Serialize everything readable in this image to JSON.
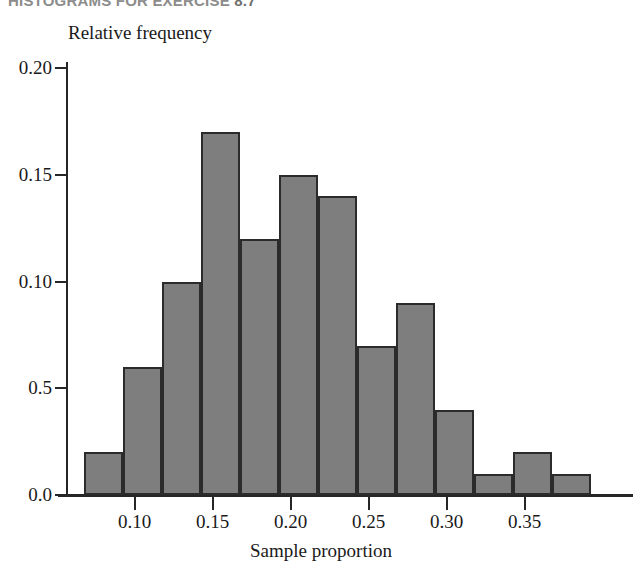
{
  "header": {
    "text": "HISTOGRAMS FOR EXERCISE ",
    "number": "8.7"
  },
  "figure": {
    "y_axis_title": "Relative frequency",
    "x_axis_title": "Sample proportion"
  },
  "chart_data": {
    "type": "bar",
    "title": "",
    "subtitle": "",
    "xlabel": "Sample proportion",
    "ylabel": "Relative frequency",
    "grid": false,
    "legend": "none",
    "bar_color": "#7e7e7e",
    "bar_edge_color": "#2b2b2b",
    "xlim": [
      0.0575,
      0.3925
    ],
    "ylim": [
      0.0,
      0.215
    ],
    "bin_width": 0.025,
    "bin_edges": [
      0.0675,
      0.0925,
      0.1175,
      0.1425,
      0.1675,
      0.1925,
      0.2175,
      0.2425,
      0.2675,
      0.2925,
      0.3175,
      0.3425,
      0.3675,
      0.3925
    ],
    "categories": [
      "0.0675-0.0925",
      "0.0925-0.1175",
      "0.1175-0.1425",
      "0.1425-0.1675",
      "0.1675-0.1925",
      "0.1925-0.2175",
      "0.2175-0.2425",
      "0.2425-0.2675",
      "0.2675-0.2925",
      "0.2925-0.3175",
      "0.3175-0.3425",
      "0.3425-0.3675",
      "0.3675-0.3925"
    ],
    "values": [
      0.02,
      0.06,
      0.1,
      0.17,
      0.12,
      0.15,
      0.14,
      0.07,
      0.09,
      0.04,
      0.01,
      0.02,
      0.01
    ],
    "x_ticks": [
      0.1,
      0.15,
      0.2,
      0.25,
      0.3,
      0.35
    ],
    "x_tick_labels": [
      "0.10",
      "0.15",
      "0.20",
      "0.25",
      "0.30",
      "0.35"
    ],
    "y_ticks": [
      0.0,
      0.05,
      0.1,
      0.15,
      0.2
    ],
    "y_tick_labels": [
      "0.0",
      "0.5",
      "0.10",
      "0.15",
      "0.20"
    ]
  },
  "geometry": {
    "baseline_y": 495,
    "axis_x": 66,
    "px_per_unit_y": 2135,
    "x_origin_px": 84,
    "px_per_unit_x": 1560
  }
}
